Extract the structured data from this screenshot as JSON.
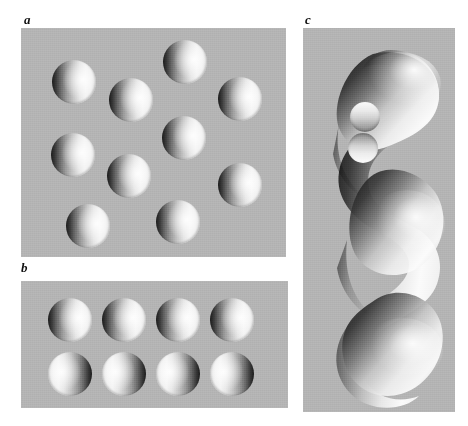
{
  "figure": {
    "kind": "shape-from-shading-figure",
    "page_background": "#ffffff",
    "plate_background": "#b4b4b4",
    "panels": [
      {
        "id": "a",
        "label": "a",
        "label_position": {
          "x": 24,
          "y": 13
        },
        "rect": {
          "x": 21,
          "y": 28,
          "w": 265,
          "h": 229
        },
        "description": "Gray plate with ten shaded discs in a staggered array, all shaded dark on the left and bright on the right",
        "lighting": "from the right",
        "disc_count": 10,
        "disc_radius": 22,
        "discs": [
          {
            "cx": 74,
            "cy": 82,
            "r": 22,
            "shading": "lit-right"
          },
          {
            "cx": 131,
            "cy": 100,
            "r": 22,
            "shading": "lit-right"
          },
          {
            "cx": 185,
            "cy": 62,
            "r": 22,
            "shading": "lit-right"
          },
          {
            "cx": 240,
            "cy": 99,
            "r": 22,
            "shading": "lit-right"
          },
          {
            "cx": 73,
            "cy": 155,
            "r": 22,
            "shading": "lit-right"
          },
          {
            "cx": 129,
            "cy": 176,
            "r": 22,
            "shading": "lit-right"
          },
          {
            "cx": 184,
            "cy": 138,
            "r": 22,
            "shading": "lit-right"
          },
          {
            "cx": 240,
            "cy": 185,
            "r": 22,
            "shading": "lit-right"
          },
          {
            "cx": 88,
            "cy": 226,
            "r": 22,
            "shading": "lit-right"
          },
          {
            "cx": 178,
            "cy": 222,
            "r": 22,
            "shading": "lit-right"
          }
        ]
      },
      {
        "id": "b",
        "label": "b",
        "label_position": {
          "x": 21,
          "y": 261
        },
        "rect": {
          "x": 21,
          "y": 281,
          "w": 267,
          "h": 127
        },
        "description": "Gray plate with two rows of four discs; the top row is shaded dark on the left, the bottom row is shaded dark on the right",
        "lighting": "top row from the right, bottom row from the left",
        "disc_count": 8,
        "disc_radius": 22,
        "discs": [
          {
            "cx": 70,
            "cy": 320,
            "r": 22,
            "shading": "lit-right"
          },
          {
            "cx": 124,
            "cy": 320,
            "r": 22,
            "shading": "lit-right"
          },
          {
            "cx": 178,
            "cy": 320,
            "r": 22,
            "shading": "lit-right"
          },
          {
            "cx": 232,
            "cy": 320,
            "r": 22,
            "shading": "lit-right"
          },
          {
            "cx": 70,
            "cy": 374,
            "r": 22,
            "shading": "lit-left"
          },
          {
            "cx": 124,
            "cy": 374,
            "r": 22,
            "shading": "lit-left"
          },
          {
            "cx": 178,
            "cy": 374,
            "r": 22,
            "shading": "lit-left"
          },
          {
            "cx": 232,
            "cy": 374,
            "r": 22,
            "shading": "lit-left"
          }
        ]
      },
      {
        "id": "c",
        "label": "c",
        "label_position": {
          "x": 305,
          "y": 13
        },
        "rect": {
          "x": 303,
          "y": 28,
          "w": 152,
          "h": 384
        },
        "description": "Gray plate containing a tall smoothly shaded serpentine solid with four alternating lobes, lit from the upper right so the left flanks fall into deep shadow; two small circular features sit on its upper portion, the upper reading as a bump and the lower as a dimple",
        "lighting": "from the upper right",
        "lobe_count": 4,
        "craters": [
          {
            "cx": 365,
            "cy": 117,
            "r": 15,
            "reads_as": "bump",
            "shading": "top"
          },
          {
            "cx": 363,
            "cy": 148,
            "r": 15,
            "reads_as": "dimple",
            "shading": "bottom"
          }
        ]
      }
    ]
  }
}
